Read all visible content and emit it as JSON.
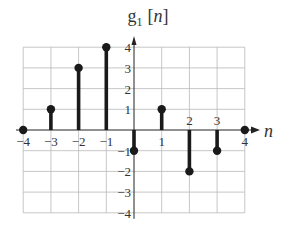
{
  "chart_data": {
    "type": "stem",
    "title_parts": {
      "base": "g",
      "subscript": "1",
      "arg": "[n]"
    },
    "xlabel": "n",
    "ylabel": "",
    "x": [
      -4,
      -3,
      -2,
      -1,
      0,
      1,
      2,
      3,
      4
    ],
    "values": [
      0,
      1,
      3,
      4,
      -1,
      1,
      -2,
      -1,
      0
    ],
    "xlim": [
      -4,
      4
    ],
    "ylim": [
      -4,
      4
    ],
    "x_tick_labels": [
      "-4",
      "-3",
      "-2",
      "-1",
      "1",
      "2",
      "3",
      "4"
    ],
    "y_tick_labels": [
      "4",
      "3",
      "2",
      "1",
      "-1",
      "-2",
      "-3",
      "-4"
    ],
    "grid": true,
    "colors": {
      "stem": "#1a1a1a",
      "grid": "#b9b9b9"
    }
  }
}
